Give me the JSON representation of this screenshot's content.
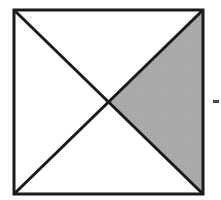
{
  "figure": {
    "caption": "",
    "canvas": {
      "width": 221,
      "height": 200,
      "background": "#ffffff"
    },
    "colors": {
      "stroke": "#1a1a1a",
      "shade_fill": "#a9a9a9",
      "interior_fill": "#ffffff",
      "leader_mark": "#2b2b2b"
    },
    "square": {
      "label": "square-outline",
      "left": 14,
      "top": 10,
      "right": 203,
      "bottom": 194,
      "width": 189,
      "height": 184,
      "stroke_width": 3
    },
    "center_point": {
      "label": "diagonal-intersection",
      "x": 108.5,
      "y": 102
    },
    "diagonals": [
      {
        "label": "diagonal-tl-br",
        "from": {
          "x": 14,
          "y": 10
        },
        "to": {
          "x": 203,
          "y": 194
        },
        "stroke_width": 3
      },
      {
        "label": "diagonal-tr-bl",
        "from": {
          "x": 203,
          "y": 10
        },
        "to": {
          "x": 14,
          "y": 194
        },
        "stroke_width": 3
      }
    ],
    "shaded_region": {
      "label": "right-quadrant-triangle",
      "fill": "#a9a9a9",
      "fraction_of_square": "1/4",
      "vertices": [
        {
          "x": 108.5,
          "y": 102
        },
        {
          "x": 203,
          "y": 10
        },
        {
          "x": 203,
          "y": 194
        }
      ]
    },
    "unshaded_regions": [
      {
        "label": "top-quadrant-triangle",
        "fill": "#ffffff"
      },
      {
        "label": "left-quadrant-triangle",
        "fill": "#ffffff"
      },
      {
        "label": "bottom-quadrant-triangle",
        "fill": "#ffffff"
      }
    ],
    "leader_mark": {
      "label": "right-edge-tick",
      "x": 213,
      "y": 100,
      "width": 6,
      "height": 3,
      "color": "#2b2b2b"
    }
  }
}
